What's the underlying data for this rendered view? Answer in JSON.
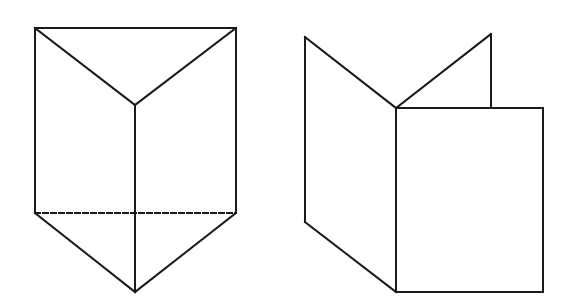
{
  "diagram": {
    "type": "geometry-line-drawing",
    "background": "#ffffff",
    "stroke_color": "#1a1a1a",
    "stroke_width": 2,
    "dash_pattern": "5 3",
    "figures": [
      {
        "name": "triangular-prism",
        "description": "Triangular prism with a vertical front edge; hidden back base edge shown dashed",
        "vertices": {
          "top_left": [
            35,
            28
          ],
          "top_right": [
            236,
            28
          ],
          "top_center": [
            135,
            105
          ],
          "bottom_left": [
            35,
            213
          ],
          "bottom_right": [
            236,
            213
          ],
          "bottom_center": [
            135,
            292
          ]
        },
        "solid_edges": [
          [
            "top_left",
            "top_right"
          ],
          [
            "top_left",
            "top_center"
          ],
          [
            "top_right",
            "top_center"
          ],
          [
            "top_left",
            "bottom_left"
          ],
          [
            "top_right",
            "bottom_right"
          ],
          [
            "top_center",
            "bottom_center"
          ],
          [
            "bottom_left",
            "bottom_center"
          ],
          [
            "bottom_right",
            "bottom_center"
          ]
        ],
        "hidden_edges": [
          [
            "bottom_left",
            "bottom_right"
          ]
        ]
      },
      {
        "name": "folded-panels",
        "description": "Three rectangular panels joined at a common vertical hinge: left panel, back panel and front square panel",
        "vertices": {
          "left_top": [
            305,
            37
          ],
          "left_bottom": [
            305,
            222
          ],
          "hinge_top": [
            396,
            108
          ],
          "hinge_bottom": [
            396,
            292
          ],
          "back_top": [
            491,
            34
          ],
          "back_base": [
            491,
            108
          ],
          "front_top_right": [
            543,
            108
          ],
          "front_bottom_right": [
            543,
            292
          ]
        },
        "solid_edges": [
          [
            "left_top",
            "left_bottom"
          ],
          [
            "left_top",
            "hinge_top"
          ],
          [
            "left_bottom",
            "hinge_bottom"
          ],
          [
            "hinge_top",
            "hinge_bottom"
          ],
          [
            "hinge_top",
            "back_top"
          ],
          [
            "back_top",
            "back_base"
          ],
          [
            "hinge_top",
            "front_top_right"
          ],
          [
            "front_top_right",
            "front_bottom_right"
          ],
          [
            "hinge_bottom",
            "front_bottom_right"
          ]
        ],
        "hidden_edges": []
      }
    ]
  }
}
